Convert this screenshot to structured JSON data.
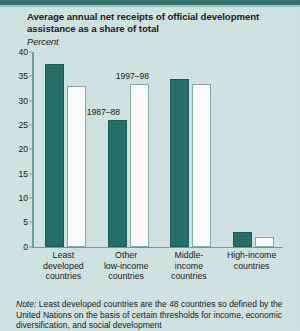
{
  "figure": {
    "title_line1": "Average annual net receipts of official development",
    "title_line2": "assistance as a share of total",
    "subtitle": "Percent",
    "note_label": "Note:",
    "note_line1": "Least developed countries are the 48 countries so defined by",
    "note_line2": "the United Nations on the basis of certain thresholds for income,",
    "note_line3": "economic diversification, and social development",
    "colors": {
      "background": "#cfe4e0",
      "rule": "#2f6e68",
      "series_1987_88": "#1d6b64",
      "series_1997_98": "#ffffff",
      "axis": "#6c9e99",
      "text": "#141414"
    }
  },
  "chart_data": {
    "type": "bar",
    "title": "Average annual net receipts of official development assistance as a share of total",
    "subtitle": "Percent",
    "xlabel": "",
    "ylabel": "Percent",
    "ylim": [
      0,
      40
    ],
    "yticks": [
      0,
      5,
      10,
      15,
      20,
      25,
      30,
      35,
      40
    ],
    "ytick_labels": [
      "0",
      "5",
      "10",
      "15",
      "20",
      "25",
      "30",
      "35",
      "40"
    ],
    "grid": false,
    "legend": "inline-annotations",
    "categories": [
      "Least developed countries",
      "Other low-income countries",
      "Middle-income countries",
      "High-income countries"
    ],
    "category_label_lines": [
      [
        "Least",
        "developed",
        "countries"
      ],
      [
        "Other",
        "low-income",
        "countries"
      ],
      [
        "Middle-",
        "income",
        "countries"
      ],
      [
        "High-income",
        "countries"
      ]
    ],
    "series": [
      {
        "name": "1987–88",
        "color": "#1d6b64",
        "values": [
          37.5,
          26.0,
          34.5,
          3.0
        ]
      },
      {
        "name": "1997–98",
        "color": "#ffffff",
        "values": [
          33.0,
          33.5,
          33.5,
          2.0
        ]
      }
    ],
    "annotations": [
      {
        "text": "1987–88",
        "series": "1987–88",
        "near_category": "Other low-income countries"
      },
      {
        "text": "1997–98",
        "series": "1997–98",
        "near_category": "Other low-income countries"
      }
    ]
  }
}
